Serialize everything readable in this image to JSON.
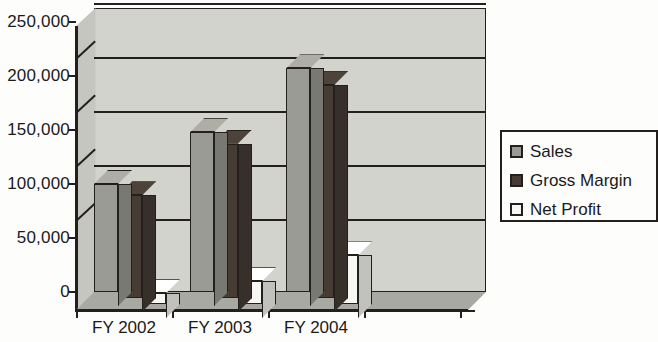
{
  "chart_data": {
    "type": "bar",
    "title": "",
    "subtitle": "",
    "xlabel": "",
    "ylabel": "",
    "categories": [
      "FY 2002",
      "FY 2003",
      "FY 2004"
    ],
    "series": [
      {
        "name": "Sales",
        "values": [
          100000,
          148000,
          207000
        ],
        "color": "#9b9b95"
      },
      {
        "name": "Gross Margin",
        "values": [
          95000,
          143000,
          197000
        ],
        "color": "#463c34"
      },
      {
        "name": "Net Profit",
        "values": [
          10000,
          21000,
          45000
        ],
        "color": "#f7f7f4"
      }
    ],
    "ylim": [
      0,
      250000
    ],
    "yticks": [
      0,
      50000,
      100000,
      150000,
      200000,
      250000
    ],
    "ytick_labels": [
      "0",
      "50,000",
      "100,000",
      "150,000",
      "200,000",
      "250,000"
    ],
    "grid": true,
    "grid_axis": "y",
    "legend_position": "right",
    "style": "3d-column",
    "plot_background": "#d3d3ce",
    "axis_color": "#231f1c",
    "page_background": "#fdfdfb"
  },
  "legend": {
    "items": [
      {
        "label": "Sales",
        "swatch": "#9b9b95"
      },
      {
        "label": "Gross Margin",
        "swatch": "#463c34"
      },
      {
        "label": "Net Profit",
        "swatch": "#f7f7f4"
      }
    ]
  }
}
